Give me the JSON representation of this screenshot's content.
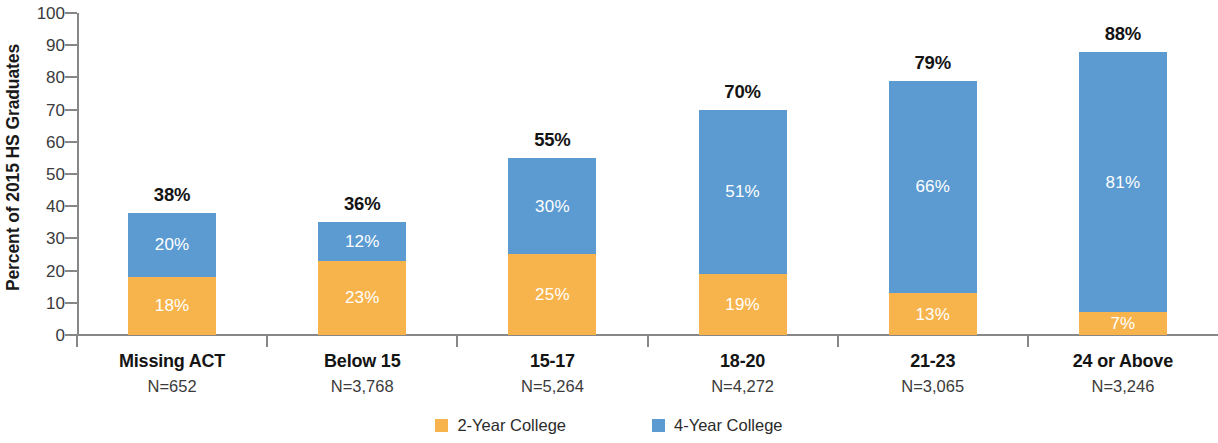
{
  "chart_data": {
    "type": "bar",
    "subtype": "stacked-bar",
    "title": "",
    "xlabel": "",
    "ylabel": "Percent of 2015 HS Graduates",
    "ylim": [
      0,
      100
    ],
    "ytick_labels": [
      "100",
      "90",
      "80",
      "70",
      "60",
      "50",
      "40",
      "30",
      "20",
      "10",
      "0"
    ],
    "ytick_values": [
      100,
      90,
      80,
      70,
      60,
      50,
      40,
      30,
      20,
      10,
      0
    ],
    "grid": false,
    "legend_position": "bottom",
    "categories": [
      "Missing ACT",
      "Below 15",
      "15-17",
      "18-20",
      "21-23",
      "24 or Above"
    ],
    "category_sublabels": [
      "N=652",
      "N=3,768",
      "N=5,264",
      "N=4,272",
      "N=3,065",
      "N=3,246"
    ],
    "series": [
      {
        "name": "2-Year College",
        "color": "#f8b44c",
        "values": [
          18,
          23,
          25,
          19,
          13,
          7
        ],
        "value_labels": [
          "18%",
          "23%",
          "25%",
          "19%",
          "13%",
          "7%"
        ]
      },
      {
        "name": "4-Year College",
        "color": "#5b9bd1",
        "values": [
          20,
          12,
          30,
          51,
          66,
          81
        ],
        "value_labels": [
          "20%",
          "12%",
          "30%",
          "51%",
          "66%",
          "81%"
        ]
      }
    ],
    "totals": [
      38,
      36,
      55,
      70,
      79,
      88
    ],
    "total_labels": [
      "38%",
      "36%",
      "55%",
      "70%",
      "79%",
      "88%"
    ]
  },
  "legend": {
    "items": [
      {
        "label": "2-Year College",
        "swatch": "sw-2yr",
        "icon": "orange-square-swatch-icon"
      },
      {
        "label": "4-Year College",
        "swatch": "sw-4yr",
        "icon": "blue-square-swatch-icon"
      }
    ]
  },
  "colors": {
    "two_year": "#f8b44c",
    "four_year": "#5b9bd1",
    "axis": "#878787",
    "text": "#141414",
    "muted_text": "#3b3b3b",
    "background": "#ffffff"
  }
}
